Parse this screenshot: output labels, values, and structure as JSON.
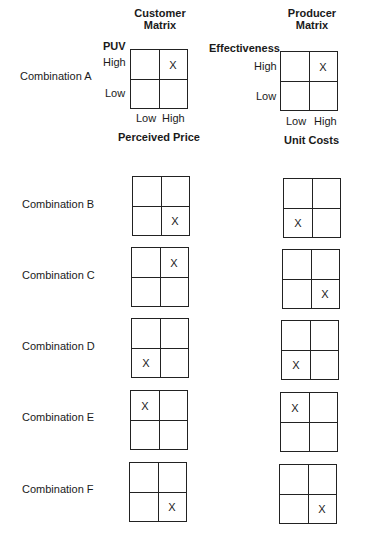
{
  "customer_matrix": {
    "title_line1": "Customer",
    "title_line2": "Matrix",
    "y_axis_label": "PUV",
    "y_high": "High",
    "y_low": "Low",
    "x_low": "Low",
    "x_high": "High",
    "x_axis_label": "Perceived Price"
  },
  "producer_matrix": {
    "title_line1": "Producer",
    "title_line2": "Matrix",
    "y_axis_label": "Effectiveness",
    "y_high": "High",
    "y_low": "Low",
    "x_low": "Low",
    "x_high": "High",
    "x_axis_label": "Unit Costs"
  },
  "mark": "X",
  "combinations": [
    {
      "label": "Combination A",
      "customer": "tr",
      "producer": "tr"
    },
    {
      "label": "Combination B",
      "customer": "br",
      "producer": "bl"
    },
    {
      "label": "Combination C",
      "customer": "tr",
      "producer": "br"
    },
    {
      "label": "Combination D",
      "customer": "bl",
      "producer": "bl"
    },
    {
      "label": "Combination E",
      "customer": "tl",
      "producer": "tl"
    },
    {
      "label": "Combination F",
      "customer": "br",
      "producer": "br"
    }
  ]
}
